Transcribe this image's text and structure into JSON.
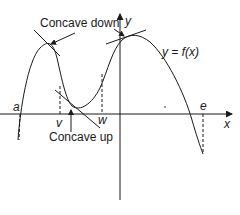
{
  "diagram": {
    "type": "function-graph-concavity",
    "function_label": "y = f(x)",
    "axes": {
      "x_label": "x",
      "y_label": "y"
    },
    "points": {
      "a": "a",
      "v": "v",
      "w": "w",
      "e": "e"
    },
    "annotations": {
      "concave_down": "Concave down",
      "concave_up": "Concave up"
    },
    "colors": {
      "stroke": "#1a1a1a",
      "background": "#ffffff"
    }
  }
}
